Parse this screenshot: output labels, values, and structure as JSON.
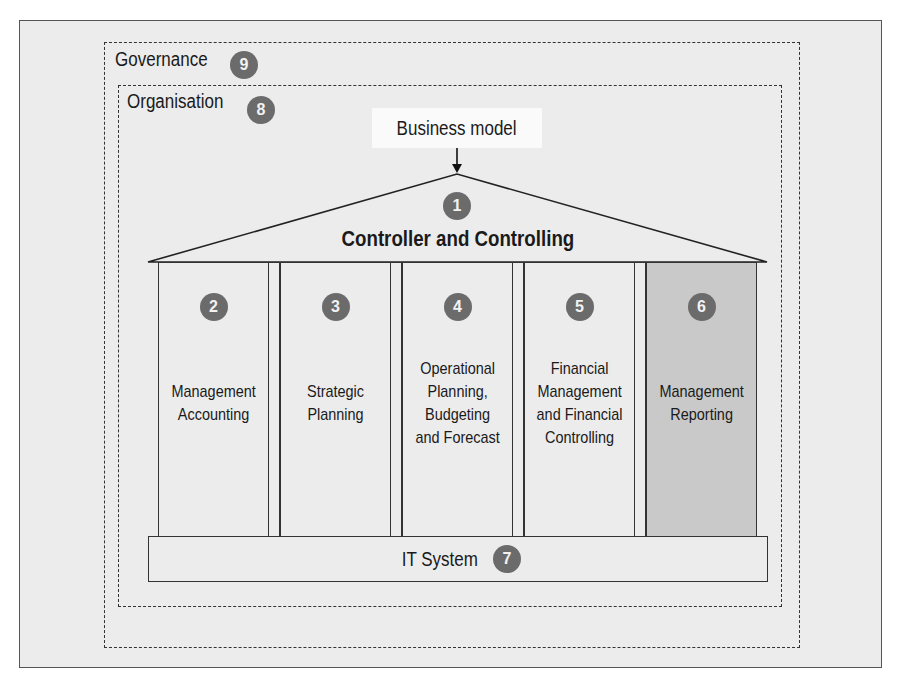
{
  "governance": {
    "label": "Governance",
    "number": "9"
  },
  "organisation": {
    "label": "Organisation",
    "number": "8"
  },
  "business_model": {
    "label": "Business model"
  },
  "roof": {
    "title": "Controller and Controlling",
    "number": "1"
  },
  "pillars": [
    {
      "number": "2",
      "label": "Management\nAccounting",
      "highlighted": false
    },
    {
      "number": "3",
      "label": "Strategic\nPlanning",
      "highlighted": false
    },
    {
      "number": "4",
      "label": "Operational\nPlanning,\nBudgeting\nand Forecast",
      "highlighted": false
    },
    {
      "number": "5",
      "label": "Financial\nManagement\nand Financial\nControlling",
      "highlighted": false
    },
    {
      "number": "6",
      "label": "Management\nReporting",
      "highlighted": true
    }
  ],
  "foundation": {
    "label": "IT System",
    "number": "7"
  },
  "colors": {
    "badge": "#6b6b6b",
    "background": "#ececec",
    "highlight": "#c9c9c9",
    "line": "#333333"
  }
}
